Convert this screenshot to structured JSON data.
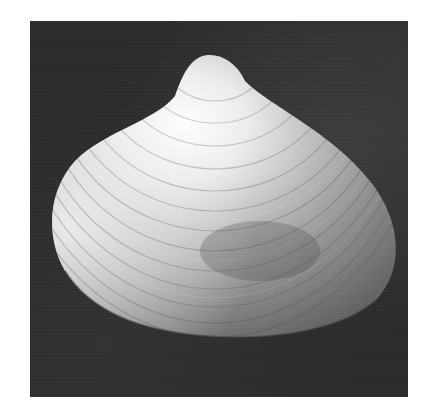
{
  "image": {
    "subject": "clam shell",
    "style": "grayscale photograph",
    "colors": {
      "canvas": "#ffffff",
      "background": "#282828",
      "shell_highlight": "#f4f4f4",
      "shell_mid": "#a8a8a8",
      "shell_shadow": "#5a5a5a"
    }
  }
}
